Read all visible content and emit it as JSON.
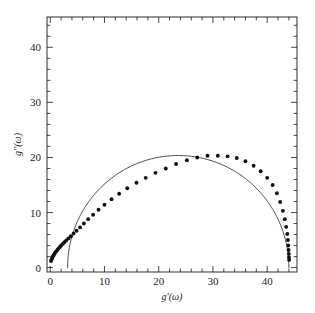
{
  "figure": {
    "background": "#ffffff",
    "ink": "#1a1a1a",
    "frame": {
      "left": 47,
      "right": 297,
      "top": 17,
      "bottom": 272
    }
  },
  "chart_data": {
    "type": "scatter",
    "title": "",
    "subtitle": "",
    "xlabel": "g'(ω)",
    "ylabel": "g''(ω)",
    "xlim": [
      -0.6,
      45.5
    ],
    "ylim": [
      -0.8,
      45.5
    ],
    "xticks": [
      0,
      10,
      20,
      30,
      40
    ],
    "yticks": [
      0,
      10,
      20,
      30,
      40
    ],
    "xtick_labels": [
      "0",
      "10",
      "20",
      "30",
      "40"
    ],
    "ytick_labels": [
      "0",
      "10",
      "20",
      "30",
      "40"
    ],
    "x_minor_step": 2,
    "y_minor_step": 2,
    "grid": false,
    "legend": false,
    "legend_position": "none",
    "tick_direction": "in",
    "marker": "filled-circle",
    "marker_color": "#111111",
    "marker_size": 3.0,
    "line_color": "#333333",
    "line_width": 0.9,
    "series": [
      {
        "name": "data",
        "kind": "markers",
        "x": [
          0.15,
          0.25,
          0.35,
          0.45,
          0.6,
          0.75,
          0.9,
          1.1,
          1.3,
          1.5,
          1.75,
          2.0,
          2.3,
          2.6,
          2.95,
          3.35,
          3.8,
          4.3,
          4.85,
          5.5,
          6.2,
          7.0,
          7.9,
          8.9,
          10.0,
          11.3,
          12.7,
          14.2,
          15.9,
          17.6,
          19.4,
          21.3,
          23.2,
          25.2,
          27.1,
          29.0,
          30.9,
          32.7,
          34.4,
          36.0,
          37.5,
          38.8,
          40.0,
          41.0,
          41.8,
          42.4,
          42.9,
          43.25,
          43.5,
          43.7,
          43.82,
          43.9,
          43.95,
          44.0,
          44.02,
          44.05
        ],
        "y": [
          1.2,
          1.5,
          1.75,
          2.0,
          2.2,
          2.45,
          2.7,
          2.95,
          3.2,
          3.45,
          3.7,
          4.0,
          4.3,
          4.6,
          4.95,
          5.3,
          5.7,
          6.2,
          6.7,
          7.3,
          8.0,
          8.8,
          9.6,
          10.5,
          11.4,
          12.4,
          13.4,
          14.4,
          15.4,
          16.3,
          17.2,
          18.0,
          18.8,
          19.5,
          20.0,
          20.3,
          20.3,
          20.2,
          19.9,
          19.3,
          18.5,
          17.5,
          16.3,
          15.0,
          13.5,
          11.9,
          10.3,
          8.8,
          7.4,
          6.1,
          5.0,
          4.0,
          3.2,
          2.5,
          1.9,
          1.4
        ]
      },
      {
        "name": "fit",
        "kind": "line",
        "description": "semicircular arc fit",
        "arc_center_x": 23.6,
        "arc_center_y": 0.0,
        "arc_radius_x": 20.4,
        "arc_radius_y": 20.35,
        "x_start": 3.2,
        "x_end": 44.0,
        "peak_x": 23.6,
        "peak_y": 20.35
      }
    ],
    "annotations": []
  }
}
